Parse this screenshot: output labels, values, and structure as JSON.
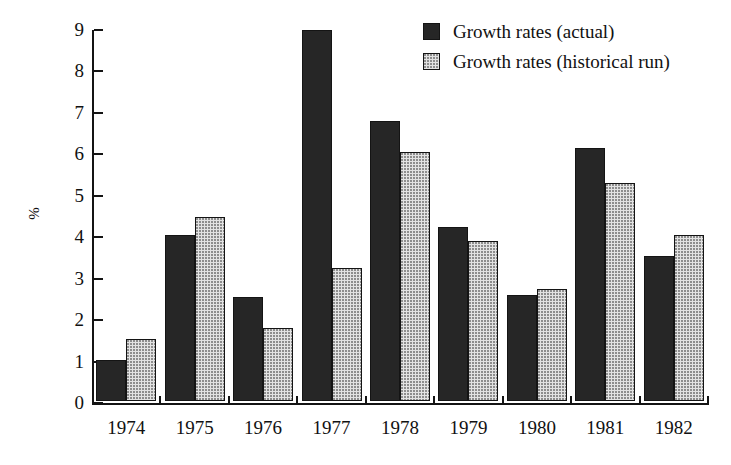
{
  "chart_data": {
    "type": "bar",
    "title": "",
    "subtitle": "",
    "xlabel": "",
    "ylabel": "%",
    "categories": [
      "1974",
      "1975",
      "1976",
      "1977",
      "1978",
      "1979",
      "1980",
      "1981",
      "1982"
    ],
    "series": [
      {
        "name": "Growth rates (actual)",
        "key": "actual",
        "color": "#262626",
        "values": [
          1.0,
          4.0,
          2.5,
          8.95,
          6.75,
          4.2,
          2.55,
          6.1,
          3.5
        ]
      },
      {
        "name": "Growth rates (historical run)",
        "key": "historical",
        "color": "#e3e3e3",
        "values": [
          1.5,
          4.45,
          1.75,
          3.2,
          6.0,
          3.85,
          2.7,
          5.25,
          4.0
        ]
      }
    ],
    "ylim": [
      0,
      9
    ],
    "yticks": [
      0,
      1,
      2,
      3,
      4,
      5,
      6,
      7,
      8,
      9
    ],
    "ytick_labels": [
      "0",
      "1",
      "2",
      "3",
      "4",
      "5",
      "6",
      "7",
      "8",
      "9"
    ],
    "grid": false,
    "legend_position": "top-right",
    "legend": [
      "Growth rates (actual)",
      "Growth rates (historical run)"
    ]
  },
  "legend": {
    "items": [
      {
        "label": "Growth rates (actual)",
        "swatch": "dark-square-icon"
      },
      {
        "label": "Growth rates (historical run)",
        "swatch": "light-square-icon"
      }
    ]
  },
  "axes": {
    "y_axis_label": "%",
    "y_tick_labels": [
      "0",
      "1",
      "2",
      "3",
      "4",
      "5",
      "6",
      "7",
      "8",
      "9"
    ],
    "x_tick_labels": [
      "1974",
      "1975",
      "1976",
      "1977",
      "1978",
      "1979",
      "1980",
      "1981",
      "1982"
    ]
  }
}
